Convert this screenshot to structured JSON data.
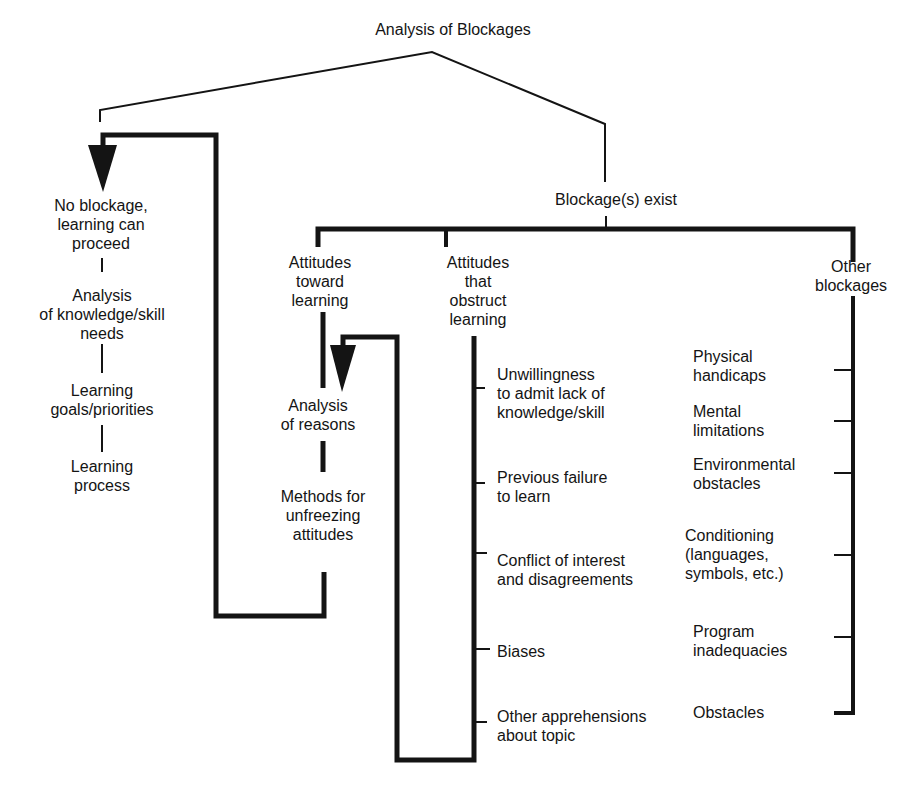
{
  "title": "Analysis of Blockages",
  "no_blockage": {
    "label": "No blockage,\nlearning can\nproceed",
    "steps": [
      "Analysis\nof knowledge/skill\nneeds",
      "Learning\ngoals/priorities",
      "Learning\nprocess"
    ]
  },
  "blockage_exist": {
    "label": "Blockage(s) exist",
    "branches": {
      "attitudes_toward": {
        "label": "Attitudes\ntoward\nlearning",
        "steps": [
          "Analysis\nof reasons",
          "Methods for\nunfreezing\nattitudes"
        ]
      },
      "attitudes_obstruct": {
        "label": "Attitudes\nthat\nobstruct\nlearning",
        "items": [
          "Unwillingness\nto admit lack of\nknowledge/skill",
          "Previous failure\nto learn",
          "Conflict of interest\nand disagreements",
          "Biases",
          "Other apprehensions\nabout topic"
        ]
      },
      "other_blockages": {
        "label": "Other\nblockages",
        "items": [
          "Physical\nhandicaps",
          "Mental\nlimitations",
          "Environmental\nobstacles",
          "Conditioning\n(languages,\nsymbols, etc.)",
          "Program\ninadequacies",
          "Obstacles"
        ]
      }
    }
  },
  "colors": {
    "ink": "#141414",
    "background": "#ffffff"
  }
}
